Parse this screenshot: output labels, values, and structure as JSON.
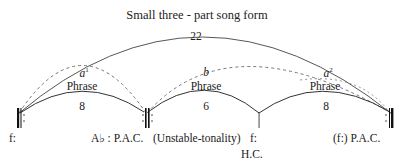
{
  "title": "Small three - part song form",
  "total_measures": "22",
  "sections": [
    {
      "letter": "a",
      "superscript": "1",
      "label": "Phrase",
      "measures": "8"
    },
    {
      "letter": "b",
      "superscript": "",
      "label": "Phrase",
      "measures": "6"
    },
    {
      "letter": "a",
      "superscript": "2",
      "label": "Phrase",
      "measures": "8"
    }
  ],
  "bottom_labels": {
    "start_key": "f:",
    "cadence_1": "A♭ : P.A.C.",
    "note": "(Unstable-tonality)",
    "key_2": "f:",
    "cadence_2": "H.C.",
    "cadence_3": "(f:) P.A.C."
  }
}
